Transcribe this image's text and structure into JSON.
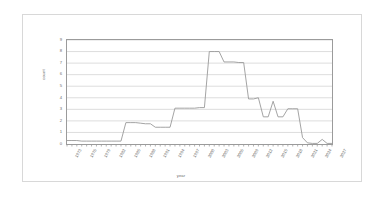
{
  "figure": {
    "background_color": "#ffffff",
    "frame_color": "#d8d8d8",
    "line_color": "#9a9a9a",
    "grid_color": "#cfcfcf",
    "axis_color": "#808080",
    "text_color": "#6d6d6d"
  },
  "chart_data": {
    "type": "line",
    "title": "",
    "xlabel": "year",
    "ylabel": "count",
    "ylim": [
      0,
      9
    ],
    "yticks": [
      0,
      1,
      2,
      3,
      4,
      5,
      6,
      7,
      8,
      9
    ],
    "grid": true,
    "legend": false,
    "legend_position": "none",
    "x_tick_labels": [
      "1973",
      "1976",
      "1979",
      "1982",
      "1985",
      "1988",
      "1991",
      "1994",
      "1997",
      "2000",
      "2003",
      "2006",
      "2009",
      "2012",
      "2015",
      "2018",
      "2021",
      "2024",
      "2027"
    ],
    "x": [
      1973,
      1974,
      1975,
      1976,
      1977,
      1978,
      1979,
      1980,
      1981,
      1982,
      1983,
      1984,
      1985,
      1986,
      1987,
      1988,
      1989,
      1990,
      1991,
      1992,
      1993,
      1994,
      1995,
      1996,
      1997,
      1998,
      1999,
      2000,
      2001,
      2002,
      2003,
      2004,
      2005,
      2006,
      2007,
      2008,
      2009,
      2010,
      2011,
      2012,
      2013,
      2014,
      2015,
      2016,
      2017,
      2018,
      2019,
      2020,
      2021,
      2022,
      2023,
      2024,
      2025,
      2026,
      2027
    ],
    "values": [
      0.3,
      0.3,
      0.3,
      0.25,
      0.25,
      0.25,
      0.25,
      0.25,
      0.25,
      0.25,
      0.25,
      0.25,
      1.85,
      1.85,
      1.85,
      1.8,
      1.75,
      1.75,
      1.45,
      1.45,
      1.45,
      1.45,
      3.1,
      3.1,
      3.1,
      3.1,
      3.1,
      3.15,
      3.15,
      8,
      8,
      8,
      7.1,
      7.1,
      7.1,
      7.05,
      7.05,
      3.9,
      3.9,
      4,
      2.35,
      2.35,
      3.7,
      2.35,
      2.35,
      3.05,
      3.05,
      3.05,
      0.55,
      0.1,
      0.05,
      0.05,
      0.4,
      0.05,
      0.05
    ],
    "series": [
      {
        "name": "count",
        "values": [
          0.3,
          0.3,
          0.3,
          0.25,
          0.25,
          0.25,
          0.25,
          0.25,
          0.25,
          0.25,
          0.25,
          0.25,
          1.85,
          1.85,
          1.85,
          1.8,
          1.75,
          1.75,
          1.45,
          1.45,
          1.45,
          1.45,
          3.1,
          3.1,
          3.1,
          3.1,
          3.1,
          3.15,
          3.15,
          8,
          8,
          8,
          7.1,
          7.1,
          7.1,
          7.05,
          7.05,
          3.9,
          3.9,
          4,
          2.35,
          2.35,
          3.7,
          2.35,
          2.35,
          3.05,
          3.05,
          3.05,
          0.55,
          0.1,
          0.05,
          0.05,
          0.4,
          0.05,
          0.05
        ]
      }
    ]
  }
}
